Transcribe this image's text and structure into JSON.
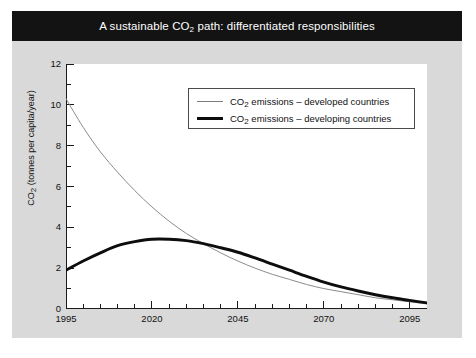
{
  "figure": {
    "title_prefix": "A sustainable CO",
    "title_sub": "2",
    "title_suffix": " path: differentiated responsibilities",
    "title_full": "A sustainable CO2 path: differentiated responsibilities",
    "panel_color": "#d9d9d9",
    "title_bar_color": "#131313",
    "plot_background": "#ffffff"
  },
  "legend": {
    "items": [
      {
        "label_prefix": "CO",
        "label_sub": "2",
        "label_suffix": " emissions – developed countries",
        "style": "thin",
        "color": "#7d7d7d"
      },
      {
        "label_prefix": "CO",
        "label_sub": "2",
        "label_suffix": " emissions – developing countries",
        "style": "thick",
        "color": "#0d0d0d"
      }
    ]
  },
  "axes": {
    "ylabel_prefix": "CO",
    "ylabel_sub": "2",
    "ylabel_suffix": " (tonnes per capita/year)",
    "ytick_labels": [
      "12",
      "10",
      "8",
      "6",
      "4",
      "2",
      "0"
    ],
    "xtick_labels": [
      "1995",
      "2020",
      "2045",
      "2070",
      "2095"
    ]
  },
  "chart_data": {
    "type": "line",
    "title": "A sustainable CO2 path: differentiated responsibilities",
    "xlabel": "",
    "ylabel": "CO2 (tonnes per capita/year)",
    "xlim": [
      1995,
      2100
    ],
    "ylim": [
      0,
      12
    ],
    "xticks": [
      1995,
      2020,
      2045,
      2070,
      2095
    ],
    "xminor_step": 5,
    "yticks": [
      0,
      2,
      4,
      6,
      8,
      10,
      12
    ],
    "yminor_step": 1,
    "grid": false,
    "legend_position": "upper right",
    "x": [
      1995,
      2000,
      2005,
      2010,
      2015,
      2020,
      2025,
      2030,
      2035,
      2040,
      2045,
      2050,
      2055,
      2060,
      2065,
      2070,
      2075,
      2080,
      2085,
      2090,
      2095,
      2100
    ],
    "series": [
      {
        "name": "CO2 emissions – developed countries",
        "style": "thin",
        "color": "#7d7d7d",
        "values": [
          10.3,
          8.9,
          7.7,
          6.7,
          5.8,
          5.0,
          4.3,
          3.7,
          3.2,
          2.75,
          2.35,
          2.0,
          1.7,
          1.45,
          1.2,
          1.0,
          0.85,
          0.7,
          0.55,
          0.45,
          0.35,
          0.25
        ]
      },
      {
        "name": "CO2 emissions – developing countries",
        "style": "thick",
        "color": "#0d0d0d",
        "values": [
          1.9,
          2.35,
          2.75,
          3.1,
          3.3,
          3.42,
          3.42,
          3.35,
          3.2,
          3.0,
          2.78,
          2.5,
          2.2,
          1.9,
          1.6,
          1.32,
          1.08,
          0.88,
          0.7,
          0.55,
          0.42,
          0.3
        ]
      }
    ]
  }
}
